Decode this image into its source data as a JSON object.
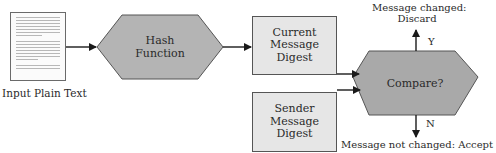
{
  "diagram": {
    "input": {
      "label": "Input Plain Text",
      "icon": "document-icon"
    },
    "hash": {
      "line1": "Hash",
      "line2": "Function"
    },
    "current_digest": {
      "line1": "Current",
      "line2": "Message",
      "line3": "Digest"
    },
    "sender_digest": {
      "line1": "Sender",
      "line2": "Message",
      "line3": "Digest"
    },
    "compare": {
      "label": "Compare?"
    },
    "yes_branch": {
      "letter": "Y",
      "line1": "Message changed:",
      "line2": "Discard"
    },
    "no_branch": {
      "letter": "N",
      "label": "Message not changed: Accept"
    },
    "colors": {
      "shape_fill": "#b4b4b4",
      "box_fill": "#e6e6e6",
      "stroke": "#555555",
      "arrow": "#1a1a1a"
    }
  }
}
